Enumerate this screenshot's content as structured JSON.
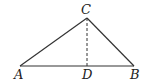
{
  "diagram": {
    "type": "triangle-with-altitude",
    "points": {
      "A": {
        "label": "A",
        "x": 20,
        "y": 66,
        "lx": 14,
        "ly": 79
      },
      "B": {
        "label": "B",
        "x": 134,
        "y": 66,
        "lx": 130,
        "ly": 79
      },
      "C": {
        "label": "C",
        "x": 87,
        "y": 18,
        "lx": 81,
        "ly": 14
      },
      "D": {
        "label": "D",
        "x": 87,
        "y": 66,
        "lx": 82,
        "ly": 79
      }
    },
    "segments": [
      {
        "from": "A",
        "to": "B",
        "style": "solid"
      },
      {
        "from": "A",
        "to": "C",
        "style": "solid"
      },
      {
        "from": "B",
        "to": "C",
        "style": "solid"
      },
      {
        "from": "C",
        "to": "D",
        "style": "dashed"
      }
    ],
    "colors": {
      "line": "#333333",
      "label": "#222222",
      "background": "#ffffff"
    }
  }
}
